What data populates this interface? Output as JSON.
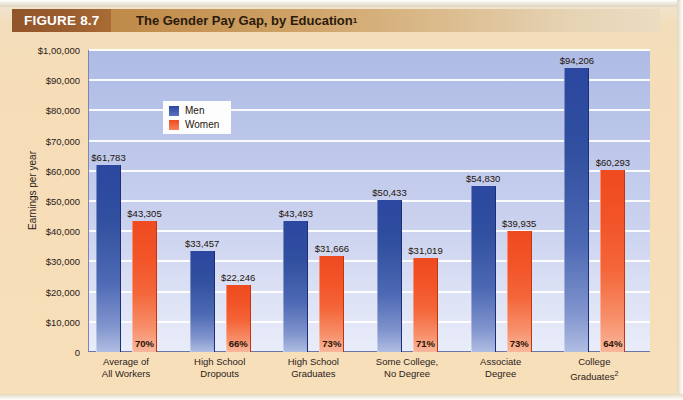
{
  "banner": {
    "figure_label": "FIGURE 8.7",
    "title": "The Gender Pay Gap, by Education",
    "title_superscript": "1"
  },
  "legend": {
    "men_label": "Men",
    "women_label": "Women"
  },
  "axis": {
    "y_title": "Earnings per year",
    "y_ticks": [
      "$1,00,000",
      "$90,000",
      "$80,000",
      "$70,000",
      "$60,000",
      "$50,000",
      "$40,000",
      "$30,000",
      "$20,000",
      "$10,000",
      "0"
    ]
  },
  "colors": {
    "men": "#2b47a0",
    "women": "#ef4a20",
    "plot_background": "#bac5e9",
    "page_background": "#f6ddb8",
    "banner_block": "#91552a"
  },
  "chart_data": {
    "type": "bar",
    "title": "The Gender Pay Gap, by Education",
    "xlabel": "",
    "ylabel": "Earnings per year",
    "ylim": [
      0,
      100000
    ],
    "ytick_values": [
      0,
      10000,
      20000,
      30000,
      40000,
      50000,
      60000,
      70000,
      80000,
      90000,
      100000
    ],
    "grid": true,
    "legend_position": "inside-upper-left",
    "categories": [
      "Average of All Workers",
      "High School Dropouts",
      "High School Graduates",
      "Some College, No Degree",
      "Associate Degree",
      "College Graduates"
    ],
    "category_lines": [
      [
        "Average of",
        "All Workers"
      ],
      [
        "High School",
        "Dropouts"
      ],
      [
        "High School",
        "Graduates"
      ],
      [
        "Some College,",
        "No Degree"
      ],
      [
        "Associate",
        "Degree"
      ],
      [
        "College",
        "Graduates"
      ]
    ],
    "category_superscripts": [
      "",
      "",
      "",
      "",
      "",
      "2"
    ],
    "series": [
      {
        "name": "Men",
        "values": [
          61783,
          33457,
          43493,
          50433,
          54830,
          94206
        ],
        "labels": [
          "$61,783",
          "$33,457",
          "$43,493",
          "$50,433",
          "$54,830",
          "$94,206"
        ]
      },
      {
        "name": "Women",
        "values": [
          43305,
          22246,
          31666,
          31019,
          39935,
          60293
        ],
        "labels": [
          "$43,305",
          "$22,246",
          "$31,666",
          "$31,019",
          "$39,935",
          "$60,293"
        ]
      }
    ],
    "ratio_annotations": [
      "70%",
      "66%",
      "73%",
      "71%",
      "73%",
      "64%"
    ]
  }
}
